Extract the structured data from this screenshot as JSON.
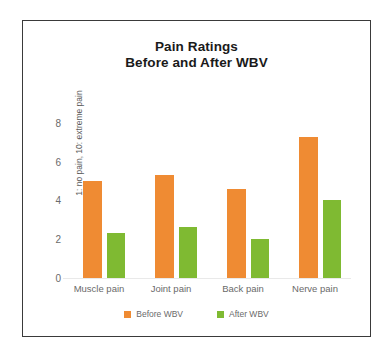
{
  "chart_data": {
    "type": "bar",
    "title": "Pain Ratings Before and After WBV",
    "title_lines": [
      "Pain Ratings",
      "Before and After WBV"
    ],
    "categories": [
      "Muscle pain",
      "Joint pain",
      "Back pain",
      "Nerve pain"
    ],
    "series": [
      {
        "name": "Before WBV",
        "color": "#ef8b33",
        "values": [
          5.0,
          5.3,
          4.6,
          7.3
        ]
      },
      {
        "name": "After WBV",
        "color": "#7fba32",
        "values": [
          2.3,
          2.65,
          2.0,
          4.0
        ]
      }
    ],
    "xlabel": "",
    "ylabel": "1: no pain, 10: extreme pain",
    "ylim": [
      0,
      8.1
    ],
    "yticks": [
      0,
      2,
      4,
      6,
      8
    ],
    "ytick_labels": [
      "0",
      "2",
      "4",
      "6",
      "8"
    ],
    "grid": false,
    "legend_position": "bottom"
  },
  "legend": {
    "items": [
      {
        "label": "Before WBV",
        "color": "#ef8b33"
      },
      {
        "label": "After WBV",
        "color": "#7fba32"
      }
    ]
  },
  "colors": {
    "before": "#ef8b33",
    "after": "#7fba32",
    "frame": "#3a3a3a",
    "text": "#6a6a6a",
    "title": "#1a1a1a"
  }
}
